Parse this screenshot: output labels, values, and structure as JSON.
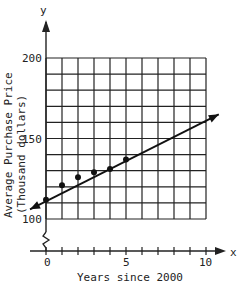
{
  "chart_data": {
    "type": "scatter",
    "title": "",
    "xlabel": "Years since 2000",
    "ylabel": "Average Purchase Price",
    "ylabel_units": "(Thousand dollars)",
    "x_axis_letter": "x",
    "y_axis_letter": "y",
    "xlim": [
      0,
      10
    ],
    "ylim": [
      100,
      200
    ],
    "x_ticks": [
      "0",
      "5",
      "10"
    ],
    "y_ticks": [
      "100",
      "150",
      "200"
    ],
    "grid": true,
    "axis_break": "y-axis broken between 0 and 100",
    "points": [
      {
        "x": 0,
        "y": 112
      },
      {
        "x": 1,
        "y": 121
      },
      {
        "x": 2,
        "y": 126
      },
      {
        "x": 3,
        "y": 129
      },
      {
        "x": 4,
        "y": 131
      },
      {
        "x": 5,
        "y": 137
      }
    ],
    "trend_line": {
      "x0": -1,
      "y0": 106,
      "x1": 10.8,
      "y1": 165,
      "arrows": "both"
    }
  }
}
